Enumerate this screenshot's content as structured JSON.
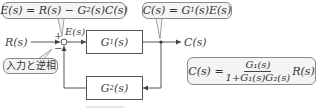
{
  "diagram": {
    "type": "feedback-control-block-diagram",
    "input_label": "R(s)",
    "output_label": "C(s)",
    "error_label": "E(s)",
    "sum_signs": {
      "plus": "+",
      "minus": "−"
    },
    "forward_block": {
      "label": "G",
      "subscript": "1",
      "arg": "(s)"
    },
    "feedback_block": {
      "label": "G",
      "subscript": "2",
      "arg": "(s)"
    },
    "callouts": {
      "error_eq": {
        "lhs": "E(s) = R(s) − G",
        "sub": "2",
        "rhs": "(s)C(s)"
      },
      "output_eq": {
        "lhs": "C(s) = G",
        "sub": "1",
        "rhs": "(s)E(s)"
      },
      "phase_note": "入力と逆相",
      "closed_loop": {
        "lhs": "C(s) =",
        "numerator": "G₁(s)",
        "denominator": "1+G₁(s)G₂(s)",
        "rhs": "R(s)"
      }
    },
    "colors": {
      "line": "#555555",
      "callout_border": "#8a8a8a",
      "callout_fill": "#f4f4f4"
    }
  }
}
